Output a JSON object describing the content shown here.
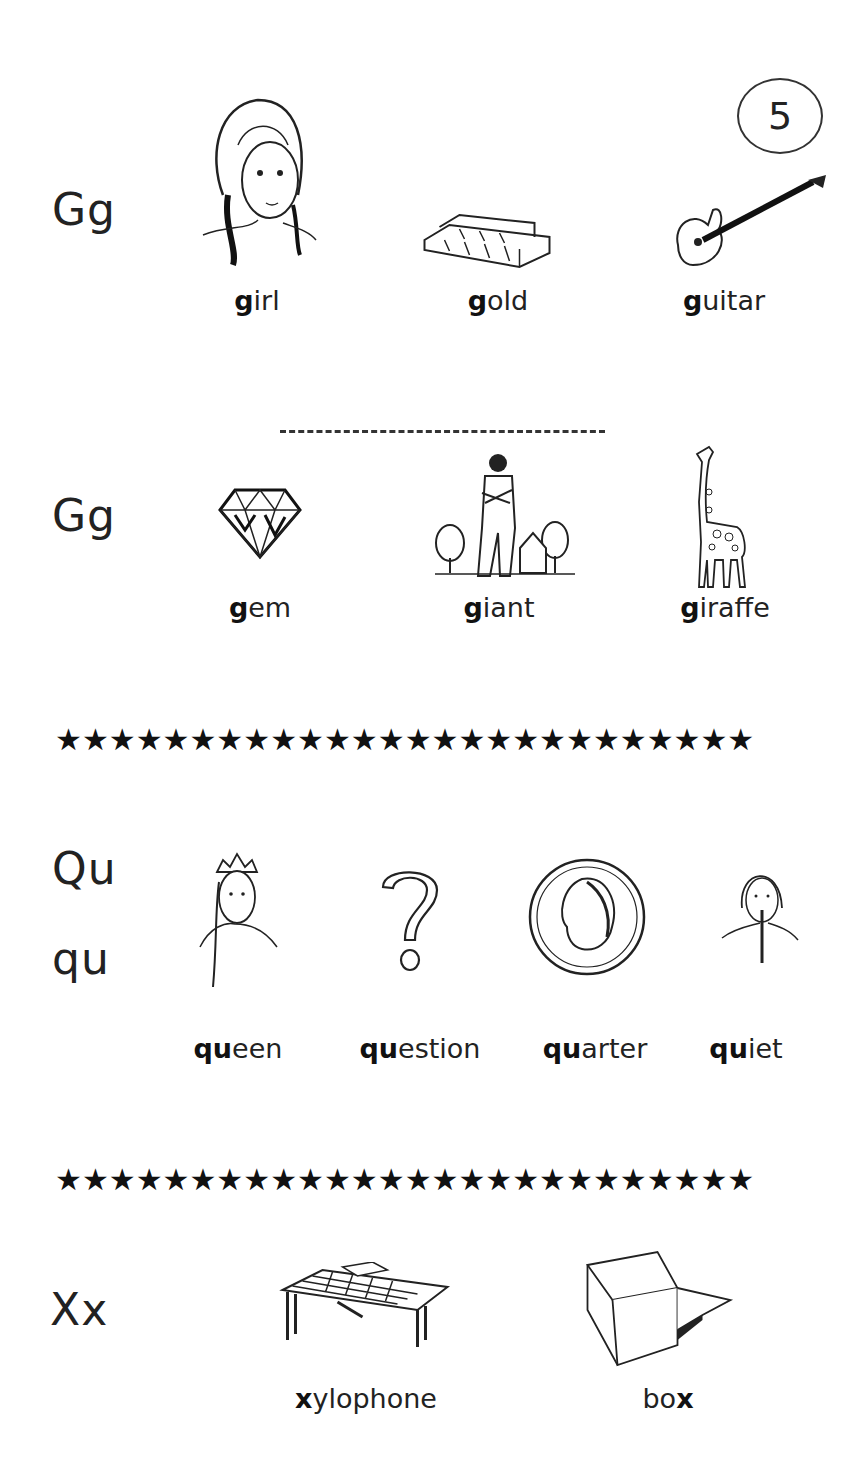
{
  "page_number": "5",
  "sections": {
    "g_hard": {
      "letter": "Gg",
      "words": [
        {
          "bold": "g",
          "rest": "irl",
          "picture": "girl"
        },
        {
          "bold": "g",
          "rest": "old",
          "picture": "gold bars"
        },
        {
          "bold": "g",
          "rest": "uitar",
          "picture": "guitar"
        }
      ]
    },
    "g_soft": {
      "letter": "Gg",
      "words": [
        {
          "bold": "g",
          "rest": "em",
          "picture": "gem"
        },
        {
          "bold": "g",
          "rest": "iant",
          "picture": "giant"
        },
        {
          "bold": "g",
          "rest": "iraffe",
          "picture": "giraffe"
        }
      ]
    },
    "qu": {
      "letter_upper": "Qu",
      "letter_lower": "qu",
      "words": [
        {
          "bold": "qu",
          "rest": "een",
          "picture": "queen"
        },
        {
          "bold": "qu",
          "rest": "estion",
          "picture": "question mark"
        },
        {
          "bold": "qu",
          "rest": "arter",
          "picture": "quarter coin"
        },
        {
          "bold": "qu",
          "rest": "iet",
          "picture": "quiet"
        }
      ]
    },
    "x": {
      "letter": "Xx",
      "words": [
        {
          "bold": "x",
          "rest": "ylophone",
          "prefix": "",
          "picture": "xylophone"
        },
        {
          "bold": "x",
          "rest": "",
          "prefix": "bo",
          "picture": "box"
        }
      ]
    }
  },
  "divider_stars": "★★★★★★★★★★★★★★★★★★★★★★★★★★",
  "colors": {
    "ink": "#1a1a1a",
    "paper": "#ffffff"
  }
}
